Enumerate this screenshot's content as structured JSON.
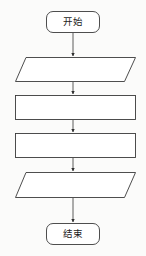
{
  "diagram": {
    "type": "flowchart",
    "orientation": "vertical",
    "title": "",
    "background_color": "#fbfbfa",
    "stroke_color": "#3a3a3a",
    "fill_color": "#ffffff",
    "text_color": "#1c1c1c",
    "nodes": [
      {
        "id": "start",
        "shape": "rounded-rectangle",
        "label": "开始",
        "x": 46,
        "y": 11,
        "width": 54,
        "height": 22
      },
      {
        "id": "io-1",
        "shape": "parallelogram",
        "label": "",
        "x": 15,
        "y": 57,
        "width": 121,
        "height": 25
      },
      {
        "id": "process-1",
        "shape": "rectangle",
        "label": "",
        "x": 15,
        "y": 95,
        "width": 121,
        "height": 25
      },
      {
        "id": "process-2",
        "shape": "rectangle",
        "label": "",
        "x": 15,
        "y": 133,
        "width": 121,
        "height": 25
      },
      {
        "id": "io-2",
        "shape": "parallelogram",
        "label": "",
        "x": 15,
        "y": 172,
        "width": 121,
        "height": 26
      },
      {
        "id": "end",
        "shape": "rounded-rectangle",
        "label": "结束",
        "x": 46,
        "y": 223,
        "width": 54,
        "height": 22
      }
    ],
    "connectors": [
      {
        "id": "start-to-io1",
        "from": "start",
        "to": "io-1",
        "x": 73,
        "y1": 33,
        "y2": 57,
        "label": ""
      },
      {
        "id": "io1-to-process1",
        "from": "io-1",
        "to": "process-1",
        "x": 73,
        "y1": 82,
        "y2": 95,
        "label": ""
      },
      {
        "id": "process1-to-process2",
        "from": "process-1",
        "to": "process-2",
        "x": 73,
        "y1": 120,
        "y2": 133,
        "label": ""
      },
      {
        "id": "process2-to-io2",
        "from": "process-2",
        "to": "io-2",
        "x": 73,
        "y1": 158,
        "y2": 172,
        "label": ""
      },
      {
        "id": "io2-to-end",
        "from": "io-2",
        "to": "end",
        "x": 73,
        "y1": 198,
        "y2": 223,
        "label": ""
      }
    ]
  }
}
